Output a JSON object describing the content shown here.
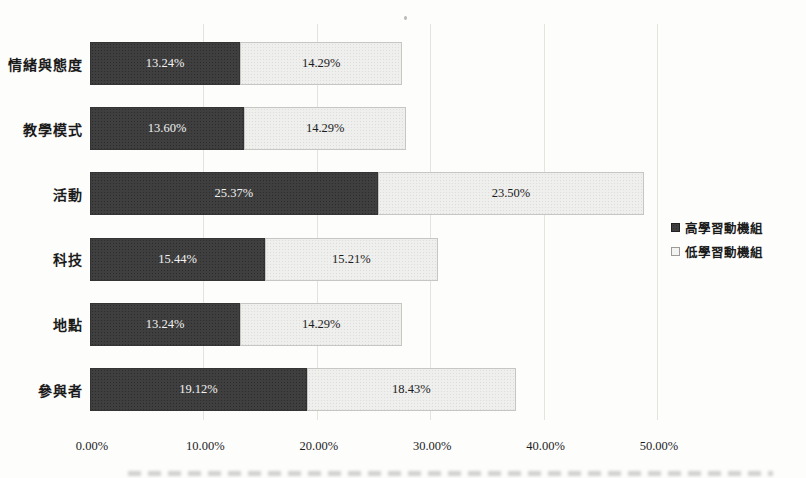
{
  "chart_data": {
    "type": "bar",
    "orientation": "horizontal",
    "stacked": true,
    "title": "",
    "categories": [
      "情緒與態度",
      "教學模式",
      "活動",
      "科技",
      "地點",
      "參與者"
    ],
    "series": [
      {
        "name": "高學習動機組",
        "swatch": "dark",
        "color": "#3f3f3f",
        "label_color": "#f2f2f2",
        "values": [
          13.24,
          13.6,
          25.37,
          15.44,
          13.24,
          19.12
        ],
        "labels": [
          "13.24%",
          "13.60%",
          "25.37%",
          "15.44%",
          "13.24%",
          "19.12%"
        ]
      },
      {
        "name": "低學習動機組",
        "swatch": "light",
        "color": "#efefee",
        "label_color": "#1c1c1c",
        "values": [
          14.29,
          14.29,
          23.5,
          15.21,
          14.29,
          18.43
        ],
        "labels": [
          "14.29%",
          "14.29%",
          "23.50%",
          "15.21%",
          "14.29%",
          "18.43%"
        ]
      }
    ],
    "x_ticks": [
      "0.00%",
      "10.00%",
      "20.00%",
      "30.00%",
      "40.00%",
      "50.00%"
    ],
    "xlim": [
      0,
      50
    ],
    "grid": "vertical",
    "legend_position": "right-middle"
  },
  "layout_hint": {
    "note": "scanned book page, grayscale halftone bars, cut-off caption strip at bottom edge"
  }
}
